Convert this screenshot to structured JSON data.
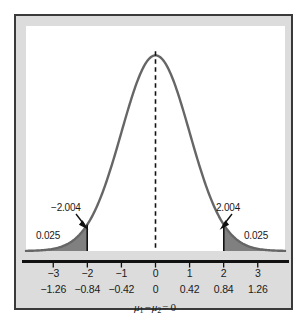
{
  "figure": {
    "frame_color": "#3a3a3a",
    "frame_background": "#dcdcdc",
    "plot_background": "#ffffff"
  },
  "annotations": {
    "critical_left": "−2.004",
    "critical_right": "2.004",
    "area_left": "0.025",
    "area_right": "0.025"
  },
  "hypothesis": {
    "mu1": "μ",
    "mu1_sub": "1",
    "minus": "−",
    "mu2": "μ",
    "mu2_sub": "2",
    "equals": "=",
    "value": "0",
    "full_text": "μ₁ − μ₂ = 0"
  },
  "chart_data": {
    "type": "line",
    "title": "",
    "subtitle": "",
    "xlabel": "μ₁ − μ₂ = 0",
    "ylabel": "",
    "distribution": "normal",
    "mean": 0,
    "sd": 1,
    "xlim": [
      -3.8,
      3.8
    ],
    "ylim": [
      0,
      0.42
    ],
    "grid": false,
    "legend": null,
    "curve_color": "#666666",
    "shade_color": "#808080",
    "axis_color": "#111111",
    "center_line": {
      "value": 0,
      "style": "dashed",
      "color": "#111111"
    },
    "critical_values": [
      -2.004,
      2.004
    ],
    "tail_areas": [
      0.025,
      0.025
    ],
    "shaded_regions": [
      {
        "from": -3.8,
        "to": -2.004,
        "area": 0.025,
        "label": "0.025"
      },
      {
        "from": 2.004,
        "to": 3.8,
        "area": 0.025,
        "label": "0.025"
      }
    ],
    "axes": [
      {
        "name": "t-scale",
        "ticks": [
          -3,
          -2,
          -1,
          0,
          1,
          2,
          3
        ],
        "tick_labels": [
          "−3",
          "−2",
          "−1",
          "0",
          "1",
          "2",
          "3"
        ]
      },
      {
        "name": "mean-difference-scale",
        "ticks": [
          -3,
          -2,
          -1,
          0,
          1,
          2,
          3
        ],
        "tick_labels": [
          "−1.26",
          "−0.84",
          "−0.42",
          "0",
          "0.42",
          "0.84",
          "1.26"
        ]
      }
    ],
    "x": [
      -3.8,
      -3.6,
      -3.4,
      -3.2,
      -3.0,
      -2.8,
      -2.6,
      -2.4,
      -2.2,
      -2.004,
      -1.8,
      -1.6,
      -1.4,
      -1.2,
      -1.0,
      -0.8,
      -0.6,
      -0.4,
      -0.2,
      0.0,
      0.2,
      0.4,
      0.6,
      0.8,
      1.0,
      1.2,
      1.4,
      1.6,
      1.8,
      2.004,
      2.2,
      2.4,
      2.6,
      2.8,
      3.0,
      3.2,
      3.4,
      3.6,
      3.8
    ],
    "y": [
      0.0003,
      0.0006,
      0.0012,
      0.0024,
      0.0044,
      0.0079,
      0.0136,
      0.0224,
      0.0355,
      0.0536,
      0.079,
      0.1109,
      0.1497,
      0.1942,
      0.242,
      0.2897,
      0.3332,
      0.3683,
      0.391,
      0.3989,
      0.391,
      0.3683,
      0.3332,
      0.2897,
      0.242,
      0.1942,
      0.1497,
      0.1109,
      0.079,
      0.0536,
      0.0355,
      0.0224,
      0.0136,
      0.0079,
      0.0044,
      0.0024,
      0.0012,
      0.0006,
      0.0003
    ]
  }
}
